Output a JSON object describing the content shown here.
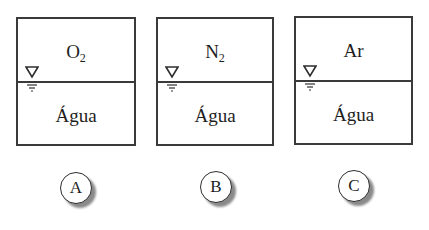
{
  "diagram": {
    "type": "three closed containers, each with gas above water, labeled by circled letters",
    "colors": {
      "stroke": "#3a3a3a",
      "text": "#1e1e1e",
      "background": "#ffffff",
      "badge_shadow": "#8a8a8a"
    },
    "containers": [
      {
        "id": "A",
        "gas_symbol": "O",
        "gas_subscript": "2",
        "gas_name": "O2",
        "liquid_label": "Água",
        "badge_label": "A",
        "level_icon": "water-level-icon"
      },
      {
        "id": "B",
        "gas_symbol": "N",
        "gas_subscript": "2",
        "gas_name": "N2",
        "liquid_label": "Água",
        "badge_label": "B",
        "level_icon": "water-level-icon"
      },
      {
        "id": "C",
        "gas_symbol": "Ar",
        "gas_subscript": "",
        "gas_name": "Ar",
        "liquid_label": "Água",
        "badge_label": "C",
        "level_icon": "water-level-icon"
      }
    ]
  }
}
